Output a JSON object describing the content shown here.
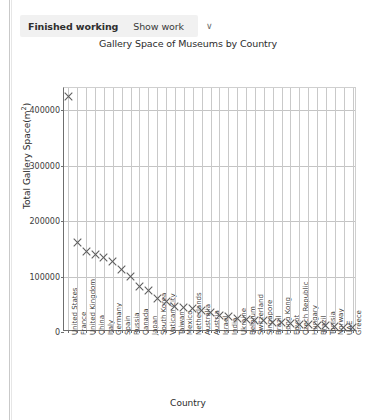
{
  "toolbar": {
    "finished_label": "Finished working",
    "show_work_label": "Show work",
    "chevron": "∨"
  },
  "chart_data": {
    "type": "scatter",
    "title": "Gallery Space of Museums by Country",
    "xlabel": "Country",
    "ylabel": "Total Gallery Space(m²)",
    "ylim": [
      0,
      440000
    ],
    "yticks": [
      0,
      100000,
      200000,
      300000,
      400000
    ],
    "ytick_labels": [
      "0",
      "100000",
      "200000",
      "300000",
      "400000"
    ],
    "grid": true,
    "legend": null,
    "marker": "x",
    "marker_color": "#5e5e5e",
    "categories": [
      "United States",
      "France",
      "United Kingdom",
      "China",
      "Italy",
      "Germany",
      "Spain",
      "Russia",
      "Canada",
      "Japan",
      "South Korea",
      "Vatican City",
      "Taiwan",
      "Mexico",
      "Netherlands",
      "Australia",
      "Austria",
      "Israel",
      "India",
      "Ukraine",
      "Belgium",
      "Switzerland",
      "Singapore",
      "Brazil",
      "Hong Kong",
      "Egypt",
      "Czech Republic",
      "Hungary",
      "Brazil",
      "Tunisia",
      "Norway",
      "UAE",
      "Greece"
    ],
    "values": [
      425000,
      162000,
      145000,
      140000,
      134000,
      128000,
      112000,
      100000,
      82000,
      74000,
      61000,
      55000,
      46000,
      44000,
      43000,
      38000,
      36000,
      30000,
      28000,
      25000,
      23000,
      21000,
      20000,
      18000,
      17000,
      15000,
      14000,
      13000,
      12000,
      11000,
      10000,
      9000,
      8000
    ]
  }
}
